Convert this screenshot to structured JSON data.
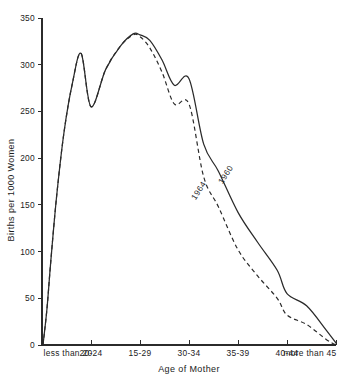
{
  "chart_data": {
    "type": "line",
    "title": "",
    "xlabel": "Age of Mother",
    "ylabel": "Births per 1000 Women",
    "categories": [
      "less than 20",
      "20-24",
      "15-29",
      "30-34",
      "35-39",
      "40-44",
      "more than 45"
    ],
    "xticklabels": [
      "less than 20",
      "20-24",
      "15-29",
      "30-34",
      "35-39",
      "40-44",
      "more than 45"
    ],
    "yticklabels": [
      "0",
      "50",
      "100",
      "150",
      "200",
      "250",
      "300",
      "350"
    ],
    "yticks": [
      0,
      50,
      100,
      150,
      200,
      250,
      300,
      350
    ],
    "ylim": [
      0,
      350
    ],
    "xlim": [
      0,
      6
    ],
    "grid": false,
    "legend_position": "inline-curve-labels",
    "line_color": "#2a2a2a",
    "background_color": "#ffffff",
    "series": [
      {
        "name": "1960",
        "style": "solid",
        "label_text": "1960",
        "label_rotation": -57,
        "values": [
          0,
          255,
          332,
          285,
          142,
          55,
          2
        ],
        "points": [
          [
            0.02,
            0
          ],
          [
            0.1,
            38
          ],
          [
            0.18,
            90
          ],
          [
            0.3,
            160
          ],
          [
            0.45,
            228
          ],
          [
            0.62,
            280
          ],
          [
            0.8,
            312
          ],
          [
            1.0,
            255
          ],
          [
            1.3,
            295
          ],
          [
            1.6,
            320
          ],
          [
            1.86,
            333
          ],
          [
            2.0,
            332
          ],
          [
            2.2,
            326
          ],
          [
            2.45,
            305
          ],
          [
            2.7,
            278
          ],
          [
            3.0,
            285
          ],
          [
            3.3,
            215
          ],
          [
            3.6,
            186
          ],
          [
            4.0,
            142
          ],
          [
            4.4,
            110
          ],
          [
            4.8,
            80
          ],
          [
            5.0,
            55
          ],
          [
            5.4,
            42
          ],
          [
            5.8,
            16
          ],
          [
            6.0,
            2
          ]
        ]
      },
      {
        "name": "1964",
        "style": "dashed",
        "label_text": "1964",
        "label_rotation": -57,
        "values": [
          0,
          255,
          330,
          258,
          102,
          32,
          0
        ],
        "points": [
          [
            0.02,
            0
          ],
          [
            0.1,
            38
          ],
          [
            0.18,
            90
          ],
          [
            0.3,
            160
          ],
          [
            0.45,
            228
          ],
          [
            0.62,
            280
          ],
          [
            0.8,
            312
          ],
          [
            1.0,
            255
          ],
          [
            1.3,
            295
          ],
          [
            1.6,
            320
          ],
          [
            1.86,
            332
          ],
          [
            2.0,
            330
          ],
          [
            2.2,
            318
          ],
          [
            2.45,
            292
          ],
          [
            2.7,
            258
          ],
          [
            3.0,
            258
          ],
          [
            3.3,
            180
          ],
          [
            3.6,
            148
          ],
          [
            4.0,
            102
          ],
          [
            4.4,
            74
          ],
          [
            4.8,
            50
          ],
          [
            5.0,
            32
          ],
          [
            5.4,
            22
          ],
          [
            5.8,
            6
          ],
          [
            6.0,
            0
          ]
        ]
      }
    ]
  },
  "figure": {
    "plot_area": {
      "left_px": 42,
      "right_px": 336,
      "top_px": 18,
      "bottom_px": 345
    }
  }
}
